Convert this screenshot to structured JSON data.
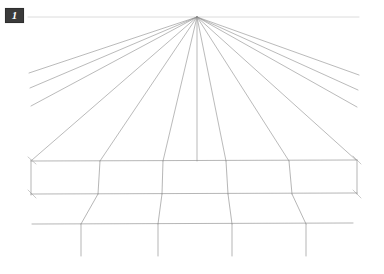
{
  "figure": {
    "badge_label": "1",
    "caption": "",
    "background_color": "#ffffff",
    "line_color": "#8c8c8c",
    "horizon_color": "#d8d8d8",
    "badge_background": "#3a3a3a",
    "badge_text_color": "#ffffff"
  },
  "chart_data": {
    "type": "diagram",
    "title": "",
    "subtitle": "",
    "xlabel": "",
    "ylabel": "",
    "canvas": {
      "width": 384,
      "height": 274
    },
    "vanishing_point": {
      "x": 197,
      "y": 17
    },
    "horizon_line": {
      "x1": 28,
      "y1": 17,
      "x2": 359,
      "y2": 17,
      "color": "#dcdcdc",
      "width": 1
    },
    "radial_lines": [
      {
        "name": "ray-L6",
        "x1": 197,
        "y1": 17,
        "x2": 29,
        "y2": 73
      },
      {
        "name": "ray-L5",
        "x1": 197,
        "y1": 17,
        "x2": 30,
        "y2": 88
      },
      {
        "name": "ray-L4",
        "x1": 197,
        "y1": 17,
        "x2": 31,
        "y2": 106
      },
      {
        "name": "ray-L3",
        "x1": 197,
        "y1": 17,
        "x2": 32,
        "y2": 160
      },
      {
        "name": "ray-L2",
        "x1": 197,
        "y1": 17,
        "x2": 100,
        "y2": 161
      },
      {
        "name": "ray-L1",
        "x1": 197,
        "y1": 17,
        "x2": 163,
        "y2": 161
      },
      {
        "name": "ray-C0",
        "x1": 197,
        "y1": 17,
        "x2": 197,
        "y2": 161
      },
      {
        "name": "ray-R1",
        "x1": 197,
        "y1": 17,
        "x2": 226,
        "y2": 161
      },
      {
        "name": "ray-R2",
        "x1": 197,
        "y1": 17,
        "x2": 289,
        "y2": 161
      },
      {
        "name": "ray-R3",
        "x1": 197,
        "y1": 17,
        "x2": 356,
        "y2": 160
      },
      {
        "name": "ray-R4",
        "x1": 197,
        "y1": 17,
        "x2": 357,
        "y2": 107
      },
      {
        "name": "ray-R5",
        "x1": 197,
        "y1": 17,
        "x2": 358,
        "y2": 90
      },
      {
        "name": "ray-R6",
        "x1": 197,
        "y1": 17,
        "x2": 359,
        "y2": 75
      }
    ],
    "horizontal_lines": [
      {
        "name": "h-line-1",
        "x1": 31,
        "y1": 161,
        "x2": 357,
        "y2": 160
      },
      {
        "name": "h-line-2",
        "x1": 31,
        "y1": 194,
        "x2": 357,
        "y2": 193
      },
      {
        "name": "h-line-3",
        "x1": 32,
        "y1": 224,
        "x2": 353,
        "y2": 223
      }
    ],
    "vertical_lines": [
      {
        "name": "v-line-left-edge",
        "x1": 31,
        "y1": 160,
        "x2": 31,
        "y2": 195
      },
      {
        "name": "v-line-1",
        "x1": 100,
        "y1": 161,
        "x2": 98,
        "y2": 194
      },
      {
        "name": "v-line-2",
        "x1": 163,
        "y1": 161,
        "x2": 162,
        "y2": 194
      },
      {
        "name": "v-line-3",
        "x1": 226,
        "y1": 161,
        "x2": 228,
        "y2": 194
      },
      {
        "name": "v-line-4",
        "x1": 289,
        "y1": 161,
        "x2": 292,
        "y2": 194
      },
      {
        "name": "v-line-right-edge",
        "x1": 357,
        "y1": 160,
        "x2": 357,
        "y2": 194
      },
      {
        "name": "v-line-lower-1",
        "x1": 98,
        "y1": 194,
        "x2": 81,
        "y2": 224
      },
      {
        "name": "v-line-lower-2",
        "x1": 162,
        "y1": 194,
        "x2": 158,
        "y2": 224
      },
      {
        "name": "v-line-lower-3",
        "x1": 228,
        "y1": 194,
        "x2": 232,
        "y2": 224
      },
      {
        "name": "v-line-lower-4",
        "x1": 292,
        "y1": 194,
        "x2": 306,
        "y2": 224
      },
      {
        "name": "v-line-tail-1",
        "x1": 81,
        "y1": 224,
        "x2": 81,
        "y2": 256
      },
      {
        "name": "v-line-tail-2",
        "x1": 158,
        "y1": 224,
        "x2": 158,
        "y2": 256
      },
      {
        "name": "v-line-tail-3",
        "x1": 232,
        "y1": 224,
        "x2": 232,
        "y2": 256
      },
      {
        "name": "v-line-tail-4",
        "x1": 306,
        "y1": 224,
        "x2": 306,
        "y2": 256
      }
    ],
    "corner_ticks": [
      {
        "name": "tick-tl",
        "x1": 28,
        "y1": 157,
        "x2": 36,
        "y2": 164
      },
      {
        "name": "tick-bl",
        "x1": 28,
        "y1": 190,
        "x2": 36,
        "y2": 198
      },
      {
        "name": "tick-tr",
        "x1": 353,
        "y1": 156,
        "x2": 361,
        "y2": 164
      },
      {
        "name": "tick-br",
        "x1": 353,
        "y1": 190,
        "x2": 361,
        "y2": 198
      }
    ],
    "legend": [],
    "annotations": [
      {
        "name": "figure-number",
        "text": "1",
        "x": 14,
        "y": 15
      }
    ]
  }
}
